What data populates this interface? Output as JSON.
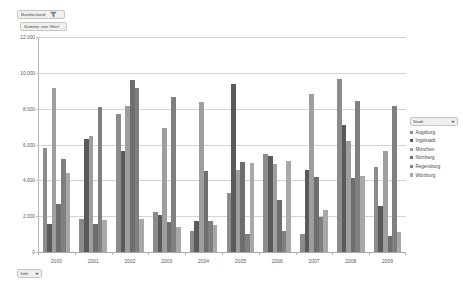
{
  "pivot": {
    "field_button": {
      "label": "Bundesland",
      "icon": "filter-icon"
    },
    "value_button": {
      "label": "Summe von Wert"
    },
    "axis_button": {
      "label": "Jahr",
      "icon": "chevron-down-icon"
    }
  },
  "legend": {
    "header_label": "Stadt",
    "header_icon": "chevron-down-icon",
    "items": [
      {
        "label": "Augsburg",
        "color": "#8c8c8c"
      },
      {
        "label": "Ingolstadt",
        "color": "#5a5a5a"
      },
      {
        "label": "München",
        "color": "#9e9e9e"
      },
      {
        "label": "Nürnberg",
        "color": "#6e6e6e"
      },
      {
        "label": "Regensburg",
        "color": "#7f7f7f"
      },
      {
        "label": "Würzburg",
        "color": "#a8a8a8"
      }
    ]
  },
  "chart_data": {
    "type": "bar",
    "title": "",
    "xlabel": "Jahr",
    "ylabel": "Summe von Wert",
    "ylim": [
      0,
      12000
    ],
    "yticks": [
      "0",
      "2.000",
      "4.000",
      "6.000",
      "8.000",
      "10.000",
      "12.000"
    ],
    "ytick_values": [
      0,
      2000,
      4000,
      6000,
      8000,
      10000,
      12000
    ],
    "grid": true,
    "legend_position": "right",
    "categories": [
      "2000",
      "2001",
      "2002",
      "2003",
      "2004",
      "2005",
      "2006",
      "2007",
      "2008",
      "2009"
    ],
    "series": [
      {
        "name": "Augsburg",
        "color": "#8c8c8c",
        "values": [
          5800,
          1850,
          7700,
          2250,
          1150,
          3300,
          5450,
          1000,
          9650,
          4750
        ]
      },
      {
        "name": "Ingolstadt",
        "color": "#5a5a5a",
        "values": [
          1550,
          6300,
          5650,
          2050,
          1750,
          9350,
          5350,
          4600,
          7100,
          2550
        ]
      },
      {
        "name": "München",
        "color": "#9e9e9e",
        "values": [
          9150,
          6500,
          8150,
          6900,
          8350,
          4600,
          4900,
          8800,
          6200,
          5650
        ]
      },
      {
        "name": "Nürnberg",
        "color": "#6e6e6e",
        "values": [
          2700,
          1550,
          9600,
          1700,
          4500,
          5000,
          2900,
          4200,
          4150,
          900
        ]
      },
      {
        "name": "Regensburg",
        "color": "#7f7f7f",
        "values": [
          5200,
          8100,
          9150,
          8650,
          1750,
          1000,
          1200,
          1950,
          8450,
          8150
        ]
      },
      {
        "name": "Würzburg",
        "color": "#a8a8a8",
        "values": [
          4400,
          1800,
          1850,
          1400,
          1500,
          4950,
          5100,
          2350,
          4250,
          1100
        ]
      }
    ]
  }
}
